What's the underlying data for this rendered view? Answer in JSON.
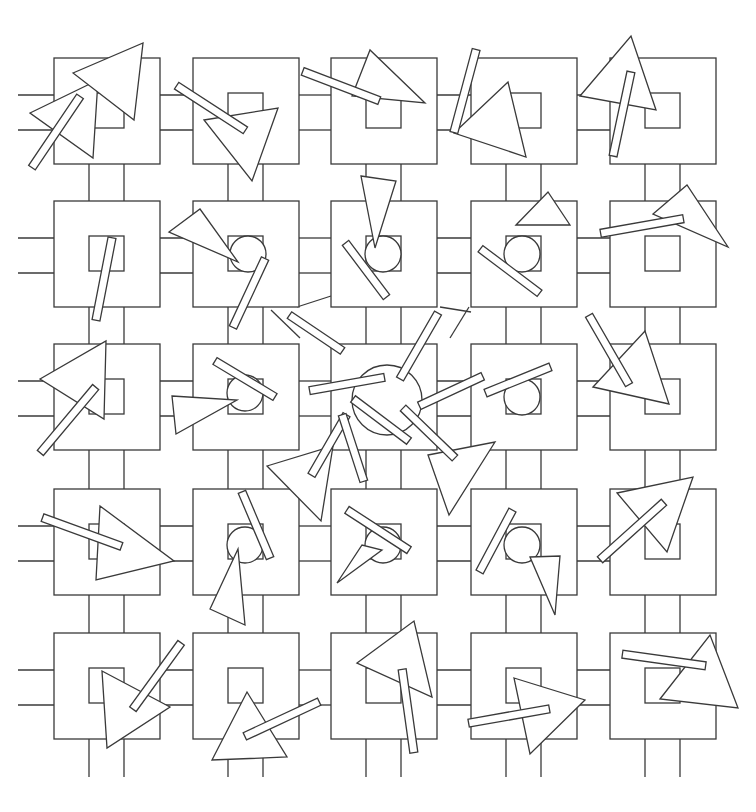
{
  "artwork": {
    "title": "Generative line drawing: grid of nested squares with rotated triangles and bars",
    "canvas": {
      "width": 756,
      "height": 812,
      "background": "#ffffff",
      "stroke": "#3a3a3a"
    },
    "grid": {
      "cols": [
        54,
        193,
        331,
        471,
        610
      ],
      "rows": [
        58,
        201,
        344,
        489,
        633
      ],
      "outer": 106,
      "inner_offset": 35,
      "inner": 35
    },
    "circles": [
      {
        "cx": 248,
        "cy": 254,
        "r": 18
      },
      {
        "cx": 383,
        "cy": 254,
        "r": 18
      },
      {
        "cx": 522,
        "cy": 254,
        "r": 18
      },
      {
        "cx": 245,
        "cy": 393,
        "r": 18
      },
      {
        "cx": 387,
        "cy": 400,
        "r": 35
      },
      {
        "cx": 522,
        "cy": 397,
        "r": 18
      },
      {
        "cx": 245,
        "cy": 545,
        "r": 18
      },
      {
        "cx": 383,
        "cy": 545,
        "r": 18
      },
      {
        "cx": 522,
        "cy": 545,
        "r": 18
      }
    ],
    "triangles": [
      [
        [
          30,
          113
        ],
        [
          98,
          80
        ],
        [
          93,
          158
        ]
      ],
      [
        [
          204,
          120
        ],
        [
          278,
          108
        ],
        [
          252,
          181
        ]
      ],
      [
        [
          352,
          96
        ],
        [
          370,
          50
        ],
        [
          425,
          103
        ]
      ],
      [
        [
          454,
          133
        ],
        [
          508,
          82
        ],
        [
          526,
          157
        ]
      ],
      [
        [
          580,
          96
        ],
        [
          631,
          36
        ],
        [
          656,
          110
        ]
      ],
      [
        [
          73,
          73
        ],
        [
          143,
          43
        ],
        [
          134,
          120
        ]
      ],
      [
        [
          169,
          232
        ],
        [
          200,
          209
        ],
        [
          238,
          262
        ]
      ],
      [
        [
          361,
          176
        ],
        [
          396,
          181
        ],
        [
          375,
          248
        ]
      ],
      [
        [
          516,
          225
        ],
        [
          548,
          192
        ],
        [
          570,
          225
        ]
      ],
      [
        [
          653,
          214
        ],
        [
          687,
          185
        ],
        [
          728,
          247
        ]
      ],
      [
        [
          40,
          379
        ],
        [
          106,
          341
        ],
        [
          104,
          419
        ]
      ],
      [
        [
          172,
          396
        ],
        [
          237,
          400
        ],
        [
          176,
          434
        ]
      ],
      [
        [
          267,
          466
        ],
        [
          333,
          446
        ],
        [
          321,
          521
        ]
      ],
      [
        [
          428,
          455
        ],
        [
          495,
          442
        ],
        [
          449,
          515
        ]
      ],
      [
        [
          593,
          387
        ],
        [
          645,
          331
        ],
        [
          669,
          404
        ]
      ],
      [
        [
          100,
          506
        ],
        [
          174,
          561
        ],
        [
          96,
          580
        ]
      ],
      [
        [
          210,
          609
        ],
        [
          238,
          549
        ],
        [
          245,
          625
        ]
      ],
      [
        [
          337,
          583
        ],
        [
          362,
          545
        ],
        [
          382,
          550
        ]
      ],
      [
        [
          530,
          557
        ],
        [
          560,
          556
        ],
        [
          555,
          615
        ]
      ],
      [
        [
          617,
          493
        ],
        [
          693,
          477
        ],
        [
          667,
          552
        ]
      ],
      [
        [
          102,
          671
        ],
        [
          170,
          707
        ],
        [
          107,
          748
        ]
      ],
      [
        [
          212,
          760
        ],
        [
          247,
          692
        ],
        [
          287,
          757
        ]
      ],
      [
        [
          357,
          663
        ],
        [
          414,
          621
        ],
        [
          432,
          697
        ]
      ],
      [
        [
          514,
          678
        ],
        [
          585,
          700
        ],
        [
          530,
          754
        ]
      ],
      [
        [
          660,
          699
        ],
        [
          710,
          635
        ],
        [
          738,
          708
        ]
      ]
    ],
    "bars": [
      {
        "cx": 56,
        "cy": 132,
        "len": 86,
        "w": 8,
        "angle": -56
      },
      {
        "cx": 211,
        "cy": 108,
        "len": 82,
        "w": 8,
        "angle": 33
      },
      {
        "cx": 341,
        "cy": 86,
        "len": 82,
        "w": 8,
        "angle": 21
      },
      {
        "cx": 465,
        "cy": 91,
        "len": 86,
        "w": 8,
        "angle": -75
      },
      {
        "cx": 622,
        "cy": 114,
        "len": 86,
        "w": 8,
        "angle": -78
      },
      {
        "cx": 104,
        "cy": 279,
        "len": 84,
        "w": 8,
        "angle": -79
      },
      {
        "cx": 249,
        "cy": 293,
        "len": 76,
        "w": 8,
        "angle": -65
      },
      {
        "cx": 366,
        "cy": 270,
        "len": 68,
        "w": 8,
        "angle": -127
      },
      {
        "cx": 510,
        "cy": 271,
        "len": 74,
        "w": 8,
        "angle": -143
      },
      {
        "cx": 642,
        "cy": 226,
        "len": 84,
        "w": 8,
        "angle": -10
      },
      {
        "cx": 68,
        "cy": 420,
        "len": 86,
        "w": 8,
        "angle": -50
      },
      {
        "cx": 245,
        "cy": 379,
        "len": 70,
        "w": 8,
        "angle": 31
      },
      {
        "cx": 347,
        "cy": 384,
        "len": 76,
        "w": 8,
        "angle": -10
      },
      {
        "cx": 419,
        "cy": 346,
        "len": 76,
        "w": 8,
        "angle": -60
      },
      {
        "cx": 451,
        "cy": 391,
        "len": 70,
        "w": 8,
        "angle": -25
      },
      {
        "cx": 316,
        "cy": 333,
        "len": 64,
        "w": 8,
        "angle": 34
      },
      {
        "cx": 329,
        "cy": 445,
        "len": 70,
        "w": 8,
        "angle": -60
      },
      {
        "cx": 353,
        "cy": 448,
        "len": 70,
        "w": 8,
        "angle": -108
      },
      {
        "cx": 381,
        "cy": 420,
        "len": 70,
        "w": 8,
        "angle": 37
      },
      {
        "cx": 429,
        "cy": 433,
        "len": 72,
        "w": 8,
        "angle": 44
      },
      {
        "cx": 518,
        "cy": 380,
        "len": 70,
        "w": 8,
        "angle": -22
      },
      {
        "cx": 609,
        "cy": 350,
        "len": 80,
        "w": 8,
        "angle": 60
      },
      {
        "cx": 82,
        "cy": 532,
        "len": 84,
        "w": 8,
        "angle": 20
      },
      {
        "cx": 256,
        "cy": 525,
        "len": 72,
        "w": 8,
        "angle": 67
      },
      {
        "cx": 378,
        "cy": 530,
        "len": 74,
        "w": 8,
        "angle": 33
      },
      {
        "cx": 496,
        "cy": 541,
        "len": 70,
        "w": 8,
        "angle": -62
      },
      {
        "cx": 632,
        "cy": 531,
        "len": 86,
        "w": 8,
        "angle": -42
      },
      {
        "cx": 157,
        "cy": 676,
        "len": 82,
        "w": 8,
        "angle": -54
      },
      {
        "cx": 282,
        "cy": 719,
        "len": 82,
        "w": 8,
        "angle": -25
      },
      {
        "cx": 408,
        "cy": 711,
        "len": 84,
        "w": 8,
        "angle": 82
      },
      {
        "cx": 509,
        "cy": 716,
        "len": 82,
        "w": 8,
        "angle": -10
      },
      {
        "cx": 664,
        "cy": 660,
        "len": 84,
        "w": 8,
        "angle": 8
      }
    ],
    "strays": [
      [
        [
          297,
          307
        ],
        [
          331,
          296
        ]
      ],
      [
        [
          440,
          307
        ],
        [
          471,
          312
        ]
      ],
      [
        [
          271,
          310
        ],
        [
          300,
          338
        ]
      ],
      [
        [
          469,
          307
        ],
        [
          450,
          338
        ]
      ]
    ]
  }
}
